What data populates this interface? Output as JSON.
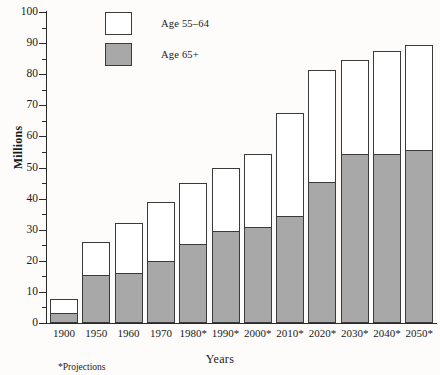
{
  "chart_data": {
    "type": "bar",
    "stacked": true,
    "title": "",
    "xlabel": "Years",
    "ylabel": "Millions",
    "ylim": [
      0,
      100
    ],
    "ytick_step": 10,
    "yminor_step": 5,
    "grid": false,
    "legend_position": "top-left-inside",
    "categories": [
      "1900",
      "1950",
      "1960",
      "1970",
      "1980*",
      "1990*",
      "2000*",
      "2010*",
      "2020*",
      "2030*",
      "2040*",
      "2050*"
    ],
    "ytick_labels": [
      "0",
      "10",
      "20",
      "30",
      "40",
      "50",
      "60",
      "70",
      "80",
      "90",
      "100"
    ],
    "series": [
      {
        "name": "Age 65+",
        "color": "#a8a8a8",
        "values": [
          3.1,
          15.5,
          16.2,
          20.1,
          25.5,
          29.5,
          31.0,
          34.5,
          45.5,
          54.5,
          54.5,
          55.5
        ]
      },
      {
        "name": "Age 55-64",
        "color": "#ffffff",
        "values": [
          4.7,
          10.5,
          15.8,
          18.9,
          19.5,
          20.5,
          23.5,
          33.0,
          36.0,
          30.0,
          33.0,
          34.0
        ]
      }
    ],
    "totals": [
      7.8,
      26.0,
      32.0,
      39.0,
      45.0,
      50.0,
      54.5,
      67.5,
      81.5,
      84.5,
      87.5,
      89.5
    ],
    "annotations": [
      "*Projections"
    ]
  },
  "legend": {
    "items": [
      {
        "label": "Age 55–64",
        "swatch": "white"
      },
      {
        "label": "Age 65+",
        "swatch": "gray"
      }
    ]
  },
  "axes": {
    "y_title": "Millions",
    "x_title": "Years"
  },
  "footnote": "*Projections"
}
